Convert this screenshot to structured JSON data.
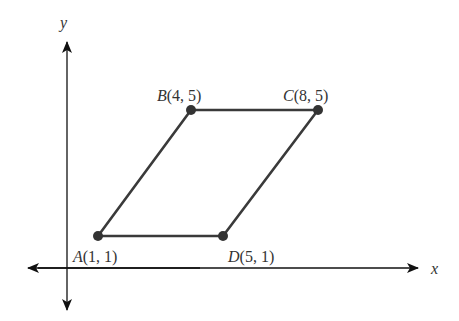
{
  "axes": {
    "x_label": "x",
    "y_label": "y"
  },
  "points": [
    {
      "name": "A",
      "coords": "(1, 1)",
      "x": 1,
      "y": 1
    },
    {
      "name": "B",
      "coords": "(4, 5)",
      "x": 4,
      "y": 5
    },
    {
      "name": "C",
      "coords": "(8, 5)",
      "x": 8,
      "y": 5
    },
    {
      "name": "D",
      "coords": "(5, 1)",
      "x": 5,
      "y": 1
    }
  ],
  "shape": "parallelogram ABCD",
  "colors": {
    "axis": "#111111",
    "edge": "#3a3a3a",
    "point": "#333333"
  }
}
